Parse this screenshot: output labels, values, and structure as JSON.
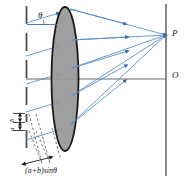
{
  "figure": {
    "labels": {
      "theta": "θ",
      "focus_point": "P",
      "axis_point": "O",
      "caption": "(a+b)sinθ",
      "slit_width": "a",
      "bar_width": "b"
    },
    "colors": {
      "ray": "#5b8fc9",
      "ray_dark": "#3a6ea5",
      "lens_fill": "#9a9a9a",
      "lens_stroke": "#1a1a1a",
      "grating": "#4d4d4d",
      "axis": "#6b6b6b",
      "screen": "#6b6b6b",
      "text": "#1a1a1a",
      "background": "#ffffff"
    },
    "geometry": {
      "lens_center_x": 65,
      "lens_center_y": 79,
      "lens_rx": 13,
      "lens_ry": 72,
      "grating_x": 26,
      "screen_x": 166,
      "axis_y": 79,
      "focus_x": 166,
      "focus_y": 35
    },
    "ray_count_incident": 5,
    "ray_count_converging": 5
  }
}
